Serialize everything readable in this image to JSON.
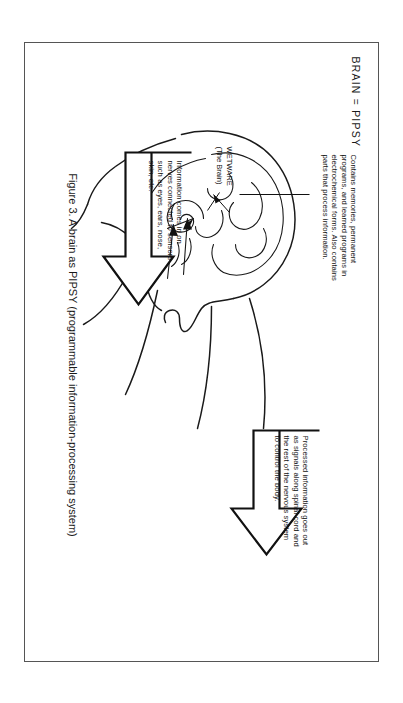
{
  "figure": {
    "title": "BRAIN = PIPSY",
    "caption": "Figure 3. A brain as PIPSY (programmable information-processing system)",
    "wetware_label_line1": "WETWARE",
    "wetware_label_line2": "(The Brain)",
    "callouts": [
      {
        "id": "memory",
        "text": "Contains memories, permanent programs, and learned programs in electrochemical forms. Also contains parts that process information."
      },
      {
        "id": "output",
        "text": "Processed information goes out as signals along spinal cord and the rest of the nervous system to control the body."
      },
      {
        "id": "input",
        "text": "Information comes in on nerves connected to sensors such as eyes, ears, nose, skin, etc."
      }
    ],
    "colors": {
      "ink": "#1a1a1a",
      "paper": "#ffffff",
      "frame": "#555555"
    }
  }
}
